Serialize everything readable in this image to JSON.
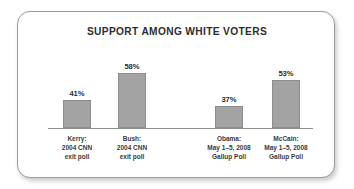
{
  "chart_data": {
    "type": "bar",
    "title": "SUPPORT AMONG WHITE VOTERS",
    "xlabel": "",
    "ylabel": "",
    "ylim": [
      0,
      70
    ],
    "grid": false,
    "legend": "none",
    "categories": [
      "Kerry: 2004 CNN exit poll",
      "Bush: 2004 CNN exit poll",
      "Obama: May 1–5, 2008 Gallup Poll",
      "McCain: May 1–5, 2008 Gallup Poll"
    ],
    "values": [
      41,
      58,
      37,
      53
    ],
    "value_labels": [
      "41%",
      "58%",
      "37%",
      "53%"
    ],
    "bars": [
      {
        "value": 41,
        "value_label": "41%",
        "label_lines": [
          "Kerry:",
          "2004 CNN",
          "exit poll"
        ],
        "left": 63,
        "width": 28,
        "top": 100
      },
      {
        "value": 58,
        "value_label": "58%",
        "label_lines": [
          "Bush:",
          "2004 CNN",
          "exit poll"
        ],
        "left": 118,
        "width": 28,
        "top": 73
      },
      {
        "value": 37,
        "value_label": "37%",
        "label_lines": [
          "Obama:",
          "May 1–5, 2008",
          "Gallup Poll"
        ],
        "left": 215,
        "width": 28,
        "top": 106
      },
      {
        "value": 53,
        "value_label": "53%",
        "label_lines": [
          "McCain:",
          "May 1–5, 2008",
          "Gallup Poll"
        ],
        "left": 272,
        "width": 28,
        "top": 80
      }
    ]
  },
  "style": {
    "bar_fill": "#a3a3a3",
    "bar_stroke": "#8d8d8d",
    "axis_color": "#8e8e8e",
    "frame_border": "#9a9a9a",
    "title_color": "#2e2e2e",
    "label_color": "#3a3a3a",
    "background": "#ffffff"
  }
}
